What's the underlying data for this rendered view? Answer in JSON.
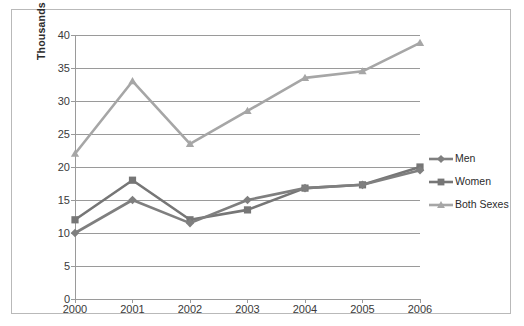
{
  "chart_data": {
    "type": "line",
    "title": "",
    "xlabel": "",
    "ylabel": "Thousands",
    "categories": [
      "2000",
      "2001",
      "2002",
      "2003",
      "2004",
      "2005",
      "2006"
    ],
    "ylim": [
      0,
      40
    ],
    "yticks": [
      0,
      5,
      10,
      15,
      20,
      25,
      30,
      35,
      40
    ],
    "ytick_labels": [
      "0",
      "5",
      "10",
      "15",
      "20",
      "25",
      "30",
      "35",
      "40"
    ],
    "grid": "horizontal",
    "legend_position": "right",
    "series": [
      {
        "name": "Men",
        "color": "#7f7f7f",
        "marker": "diamond",
        "values": [
          10,
          15,
          11.5,
          15,
          16.8,
          17.3,
          19.5
        ]
      },
      {
        "name": "Women",
        "color": "#767676",
        "marker": "square",
        "values": [
          12,
          18,
          12,
          13.5,
          16.8,
          17.3,
          20
        ]
      },
      {
        "name": "Both Sexes",
        "color": "#a6a6a6",
        "marker": "triangle",
        "values": [
          22,
          33,
          23.5,
          28.5,
          33.5,
          34.5,
          38.8
        ]
      }
    ]
  },
  "legend": {
    "items": [
      {
        "label": "Men"
      },
      {
        "label": "Women"
      },
      {
        "label": "Both Sexes"
      }
    ]
  },
  "colors": {
    "men": "#7f7f7f",
    "women": "#767676",
    "both_sexes": "#a6a6a6",
    "gridline": "#9a9a9a",
    "axis": "#9a9a9a",
    "frame": "#b9b9b9",
    "text": "#3a3a3a",
    "background": "#ffffff"
  }
}
